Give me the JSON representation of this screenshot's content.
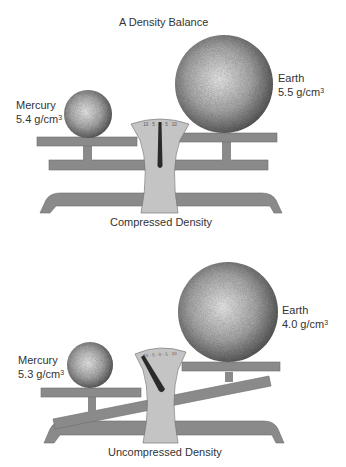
{
  "title": "A Density Balance",
  "panels": [
    {
      "caption": "Compressed Density",
      "left": {
        "name": "Mercury",
        "density": "5.4 g/cm",
        "unit_sup": "3"
      },
      "right": {
        "name": "Earth",
        "density": "5.5 g/cm",
        "unit_sup": "3"
      },
      "balance_state": "level"
    },
    {
      "caption": "Uncompressed Density",
      "left": {
        "name": "Mercury",
        "density": "5.3 g/cm",
        "unit_sup": "3"
      },
      "right": {
        "name": "Earth",
        "density": "4.0 g/cm",
        "unit_sup": "3"
      },
      "balance_state": "tilted-left-down"
    }
  ],
  "dial_marks": "10 · 5 · 0 · 5 · 10",
  "colors": {
    "metal": "#8a8a8a",
    "pedestal": "#c4c4c4",
    "needle": "#2a2a2a",
    "sphere_dark": "#5a5a5a",
    "sphere_light": "#e8e8e8"
  }
}
